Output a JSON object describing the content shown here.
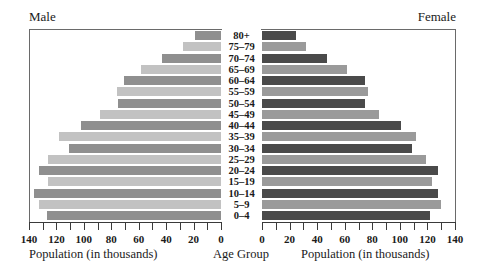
{
  "chart_data": {
    "type": "bar",
    "subtype": "population-pyramid",
    "orientation": "horizontal",
    "categories": [
      "80+",
      "75–79",
      "70–74",
      "65–69",
      "60–64",
      "55–59",
      "50–54",
      "45–49",
      "40–44",
      "35–39",
      "30–34",
      "25–29",
      "20–24",
      "15–19",
      "10–14",
      "5–9",
      "0–4"
    ],
    "series": [
      {
        "name": "Male",
        "values": [
          19,
          28,
          43,
          58,
          71,
          76,
          75,
          88,
          102,
          118,
          111,
          126,
          133,
          126,
          136,
          133,
          127
        ]
      },
      {
        "name": "Female",
        "values": [
          25,
          32,
          47,
          62,
          75,
          77,
          75,
          85,
          101,
          112,
          109,
          119,
          128,
          123,
          128,
          130,
          122
        ]
      }
    ],
    "title": "",
    "panel_titles": {
      "left": "Male",
      "right": "Female"
    },
    "xlabel_left": "Population (in thousands)",
    "xlabel_right": "Population (in thousands)",
    "center_label": "Age Group",
    "xlim": [
      0,
      140
    ],
    "x_ticks": [
      0,
      20,
      40,
      60,
      80,
      100,
      120,
      140
    ],
    "x_minor_step": 10,
    "grid": false,
    "legend": "none",
    "colors": {
      "male_dark": "#8f8f8f",
      "male_light": "#c2c2c2",
      "female_dark": "#4a4a4a",
      "female_light": "#9a9a9a"
    }
  }
}
